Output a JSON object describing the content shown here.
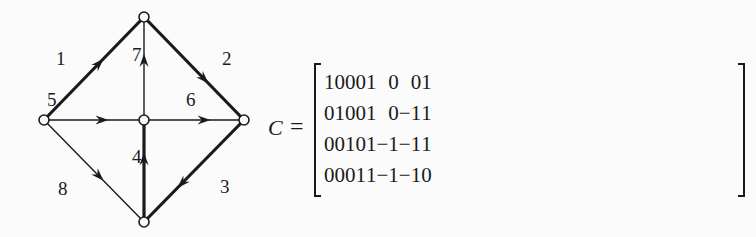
{
  "graph": {
    "nodes": [
      {
        "id": "top"
      },
      {
        "id": "left"
      },
      {
        "id": "center"
      },
      {
        "id": "right"
      },
      {
        "id": "bottom"
      }
    ],
    "edges": [
      {
        "label": "1",
        "from": "left",
        "to": "top",
        "tree": true
      },
      {
        "label": "2",
        "from": "top",
        "to": "right",
        "tree": true
      },
      {
        "label": "3",
        "from": "right",
        "to": "bottom",
        "tree": true
      },
      {
        "label": "4",
        "from": "bottom",
        "to": "center",
        "tree": true
      },
      {
        "label": "5",
        "from": "left",
        "to": "center",
        "tree": false
      },
      {
        "label": "6",
        "from": "center",
        "to": "right",
        "tree": false
      },
      {
        "label": "7",
        "from": "center",
        "to": "top",
        "tree": false
      },
      {
        "label": "8",
        "from": "left",
        "to": "bottom",
        "tree": false
      }
    ]
  },
  "equation": {
    "symbol": "C",
    "equals": "="
  },
  "matrix": {
    "rows": [
      [
        "1",
        "0",
        "0",
        "0",
        "1",
        "0",
        "0",
        "1"
      ],
      [
        "0",
        "1",
        "0",
        "0",
        "1",
        "0",
        "−1",
        "1"
      ],
      [
        "0",
        "0",
        "1",
        "0",
        "1",
        "−1",
        "−1",
        "1"
      ],
      [
        "0",
        "0",
        "0",
        "1",
        "1",
        "−1",
        "−1",
        "0"
      ]
    ]
  }
}
